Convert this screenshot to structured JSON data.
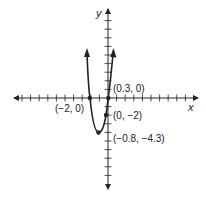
{
  "chart_data": {
    "type": "line",
    "title": "",
    "xlabel": "x",
    "ylabel": "y",
    "function": "quadratic (upward-opening parabola)",
    "equation_approx": "y = 3.33(x + 2)(x - 0.3)",
    "xlim": [
      -10,
      10
    ],
    "ylim": [
      -10,
      10
    ],
    "tick_step": 1,
    "grid": false,
    "points": [
      {
        "x": -2,
        "y": 0,
        "label": "(−2, 0)",
        "role": "x-intercept"
      },
      {
        "x": 0.3,
        "y": 0,
        "label": "(0.3, 0)",
        "role": "x-intercept"
      },
      {
        "x": 0,
        "y": -2,
        "label": "(0, −2)",
        "role": "y-intercept"
      },
      {
        "x": -0.8,
        "y": -4.3,
        "label": "(−0.8, −4.3)",
        "role": "vertex"
      }
    ]
  },
  "labels": {
    "x_axis": "x",
    "y_axis": "y",
    "p_neg2_0": "(−2, 0)",
    "p_03_0": "(0.3, 0)",
    "p_0_neg2": "(0, −2)",
    "p_vertex": "(−0.8, −4.3)"
  },
  "colors": {
    "ink": "#222222",
    "background": "#ffffff"
  }
}
